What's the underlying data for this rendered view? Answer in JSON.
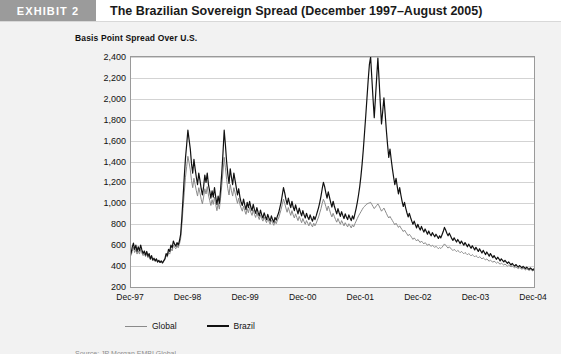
{
  "header": {
    "exhibit_tag": "EXHIBIT 2",
    "title": "The Brazilian Sovereign Spread (December 1997–August 2005)"
  },
  "figure": {
    "axis_title": "Basis Point Spread Over U.S.",
    "source_note": "Source: JP Morgan EMBI Global"
  },
  "colors": {
    "exhibit_tag_bg": "#9b9b9b",
    "page_bg": "#f2f2f2",
    "plot_bg": "#ffffff",
    "gridline": "#d3d3d3",
    "series_global": "#8a8a8a",
    "series_brazil": "#111111"
  },
  "legend": {
    "position": "bottom-left",
    "items": [
      {
        "label": "Global",
        "color": "#8a8a8a",
        "key": "legend-item-global"
      },
      {
        "label": "Brazil",
        "color": "#111111",
        "key": "legend-item-brazil"
      }
    ]
  },
  "chart_data": {
    "type": "line",
    "title": "The Brazilian Sovereign Spread (December 1997–August 2005)",
    "xlabel": "",
    "ylabel": "Basis Point Spread Over U.S.",
    "ylim": [
      200,
      2400
    ],
    "yticks": [
      2400,
      2200,
      2000,
      1800,
      1600,
      1400,
      1200,
      1000,
      800,
      600,
      400,
      200
    ],
    "ytick_labels": [
      "2,400",
      "2,200",
      "2,000",
      "1,800",
      "1,600",
      "1,400",
      "1,200",
      "1,000",
      "800",
      "600",
      "400",
      "200"
    ],
    "grid": true,
    "xlim": [
      "Dec-97",
      "Dec-04"
    ],
    "xticks": [
      "Dec-97",
      "Dec-98",
      "Dec-99",
      "Dec-00",
      "Dec-01",
      "Dec-02",
      "Dec-03",
      "Dec-04"
    ],
    "legend_position": "below-axes",
    "series": [
      {
        "name": "Brazil",
        "color": "#111111",
        "values": [
          520,
          580,
          620,
          560,
          600,
          540,
          585,
          545,
          600,
          555,
          520,
          545,
          505,
          540,
          495,
          520,
          470,
          500,
          460,
          475,
          450,
          470,
          440,
          455,
          435,
          450,
          430,
          450,
          470,
          520,
          500,
          560,
          540,
          600,
          575,
          640,
          610,
          590,
          625,
          600,
          640,
          700,
          860,
          1050,
          1250,
          1430,
          1560,
          1700,
          1610,
          1520,
          1380,
          1290,
          1420,
          1330,
          1250,
          1180,
          1290,
          1220,
          1140,
          1080,
          1160,
          1270,
          1200,
          1290,
          1180,
          1120,
          1050,
          1120,
          1060,
          1150,
          1060,
          990,
          1070,
          1000,
          1130,
          1290,
          1480,
          1700,
          1560,
          1400,
          1280,
          1190,
          1330,
          1250,
          1180,
          1290,
          1220,
          1150,
          1080,
          1140,
          1060,
          1010,
          980,
          1040,
          985,
          940,
          1010,
          960,
          1020,
          965,
          930,
          990,
          940,
          905,
          960,
          915,
          880,
          935,
          890,
          860,
          910,
          875,
          845,
          895,
          860,
          830,
          880,
          845,
          820,
          865,
          840,
          880,
          910,
          960,
          1010,
          1080,
          1150,
          1100,
          1040,
          990,
          1050,
          1000,
          960,
          1020,
          965,
          930,
          985,
          940,
          900,
          955,
          915,
          880,
          930,
          890,
          860,
          905,
          870,
          845,
          890,
          855,
          830,
          875,
          845,
          880,
          920,
          960,
          1010,
          1070,
          1140,
          1200,
          1160,
          1100,
          1050,
          1110,
          1060,
          1010,
          965,
          1020,
          975,
          935,
          900,
          950,
          910,
          875,
          920,
          885,
          855,
          900,
          870,
          845,
          890,
          860,
          835,
          880,
          850,
          900,
          950,
          1010,
          1080,
          1160,
          1260,
          1380,
          1520,
          1680,
          1840,
          2010,
          2180,
          2330,
          2400,
          2200,
          2000,
          1820,
          2010,
          2200,
          2390,
          2180,
          1960,
          1760,
          1880,
          2010,
          1860,
          1700,
          1560,
          1440,
          1520,
          1420,
          1330,
          1250,
          1180,
          1240,
          1160,
          1090,
          1150,
          1080,
          1020,
          970,
          1010,
          955,
          910,
          870,
          905,
          865,
          830,
          800,
          830,
          795,
          765,
          800,
          770,
          745,
          780,
          750,
          725,
          755,
          730,
          705,
          735,
          710,
          690,
          720,
          700,
          680,
          705,
          685,
          665,
          690,
          670,
          700,
          730,
          770,
          745,
          715,
          690,
          715,
          690,
          665,
          645,
          670,
          650,
          630,
          655,
          635,
          615,
          640,
          620,
          600,
          625,
          605,
          585,
          610,
          590,
          570,
          595,
          575,
          555,
          580,
          560,
          540,
          565,
          545,
          525,
          550,
          530,
          510,
          535,
          515,
          495,
          520,
          500,
          480,
          500,
          480,
          465,
          485,
          470,
          450,
          470,
          455,
          440,
          455,
          440,
          425,
          440,
          425,
          410,
          425,
          412,
          400,
          415,
          402,
          390,
          405,
          395,
          382,
          398,
          386,
          375,
          390,
          378,
          368,
          382,
          372,
          362,
          376
        ]
      },
      {
        "name": "Global",
        "color": "#8a8a8a",
        "values": [
          500,
          540,
          580,
          530,
          560,
          515,
          545,
          515,
          560,
          525,
          500,
          520,
          490,
          515,
          480,
          500,
          460,
          485,
          450,
          465,
          445,
          460,
          435,
          448,
          430,
          445,
          428,
          445,
          460,
          500,
          485,
          530,
          515,
          565,
          545,
          600,
          580,
          565,
          595,
          575,
          610,
          660,
          790,
          950,
          1100,
          1250,
          1350,
          1450,
          1390,
          1320,
          1220,
          1150,
          1240,
          1180,
          1120,
          1070,
          1150,
          1100,
          1040,
          995,
          1060,
          1140,
          1090,
          1160,
          1080,
          1030,
          980,
          1035,
          990,
          1060,
          990,
          930,
          1000,
          945,
          1050,
          1170,
          1300,
          1440,
          1340,
          1230,
          1140,
          1080,
          1180,
          1120,
          1070,
          1150,
          1100,
          1050,
          1000,
          1050,
          990,
          955,
          925,
          975,
          930,
          895,
          950,
          910,
          960,
          915,
          885,
          935,
          895,
          865,
          910,
          875,
          845,
          890,
          855,
          830,
          870,
          840,
          815,
          855,
          825,
          800,
          840,
          815,
          790,
          830,
          805,
          840,
          860,
          900,
          940,
          990,
          1040,
          1000,
          955,
          915,
          960,
          920,
          885,
          930,
          890,
          860,
          900,
          865,
          835,
          875,
          845,
          815,
          855,
          825,
          800,
          835,
          810,
          785,
          820,
          795,
          775,
          810,
          785,
          810,
          840,
          870,
          910,
          950,
          1000,
          1040,
          1010,
          970,
          930,
          975,
          940,
          900,
          870,
          905,
          875,
          845,
          820,
          855,
          825,
          800,
          835,
          810,
          785,
          815,
          795,
          775,
          805,
          785,
          765,
          795,
          775,
          805,
          830,
          855,
          880,
          900,
          920,
          940,
          960,
          970,
          985,
          995,
          1000,
          1005,
          1010,
          990,
          970,
          950,
          965,
          980,
          995,
          975,
          950,
          925,
          940,
          955,
          930,
          905,
          880,
          860,
          875,
          855,
          835,
          815,
          795,
          810,
          790,
          770,
          785,
          765,
          748,
          730,
          745,
          725,
          708,
          690,
          705,
          690,
          672,
          655,
          670,
          655,
          640,
          655,
          640,
          625,
          640,
          625,
          612,
          625,
          612,
          598,
          612,
          600,
          588,
          600,
          590,
          578,
          590,
          578,
          566,
          578,
          568,
          580,
          595,
          612,
          600,
          585,
          572,
          585,
          572,
          560,
          548,
          560,
          550,
          538,
          550,
          540,
          528,
          540,
          530,
          518,
          530,
          520,
          508,
          520,
          510,
          498,
          510,
          500,
          488,
          500,
          490,
          478,
          490,
          480,
          468,
          480,
          470,
          458,
          468,
          458,
          446,
          458,
          448,
          436,
          448,
          438,
          428,
          438,
          428,
          418,
          428,
          420,
          410,
          420,
          410,
          400,
          410,
          402,
          392,
          400,
          392,
          384,
          392,
          384,
          376,
          384,
          378,
          370,
          378,
          372,
          364,
          372,
          366,
          358,
          366,
          360,
          354,
          362
        ]
      }
    ]
  }
}
